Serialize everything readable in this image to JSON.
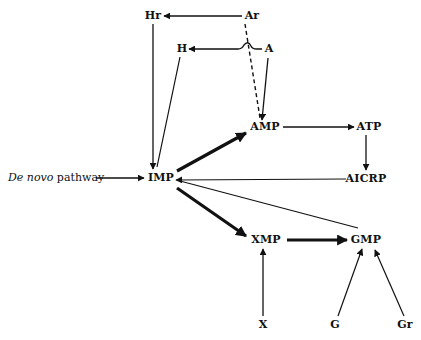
{
  "diagram": {
    "nodes": {
      "Hr": {
        "label": "Hr"
      },
      "Ar": {
        "label": "Ar"
      },
      "H": {
        "label": "H"
      },
      "A": {
        "label": "A"
      },
      "AMP": {
        "label": "AMP"
      },
      "ATP": {
        "label": "ATP"
      },
      "IMP": {
        "label": "IMP"
      },
      "AICRP": {
        "label": "AICRP"
      },
      "XMP": {
        "label": "XMP"
      },
      "GMP": {
        "label": "GMP"
      },
      "X": {
        "label": "X"
      },
      "G": {
        "label": "G"
      },
      "Gr": {
        "label": "Gr"
      }
    },
    "de_novo": {
      "italic": "De novo",
      "rest": " pathway"
    },
    "edges": [
      {
        "from": "Ar",
        "to": "Hr",
        "style": "thin"
      },
      {
        "from": "A",
        "to": "H",
        "style": "thin",
        "note": "hops over dashed line"
      },
      {
        "from": "Ar",
        "to": "AMP",
        "style": "dashed"
      },
      {
        "from": "A",
        "to": "AMP",
        "style": "thin"
      },
      {
        "from": "Hr",
        "to": "IMP",
        "style": "thin"
      },
      {
        "from": "H",
        "to": "IMP",
        "style": "thin"
      },
      {
        "from": "De novo pathway",
        "to": "IMP",
        "style": "thin"
      },
      {
        "from": "IMP",
        "to": "AMP",
        "style": "thick"
      },
      {
        "from": "AMP",
        "to": "ATP",
        "style": "thin"
      },
      {
        "from": "ATP",
        "to": "AICRP",
        "style": "thin"
      },
      {
        "from": "AICRP",
        "to": "IMP",
        "style": "thin"
      },
      {
        "from": "GMP",
        "to": "IMP",
        "style": "thin"
      },
      {
        "from": "IMP",
        "to": "XMP",
        "style": "thick"
      },
      {
        "from": "XMP",
        "to": "GMP",
        "style": "thick"
      },
      {
        "from": "X",
        "to": "XMP",
        "style": "thin"
      },
      {
        "from": "G",
        "to": "GMP",
        "style": "thin"
      },
      {
        "from": "Gr",
        "to": "GMP",
        "style": "thin"
      }
    ]
  }
}
